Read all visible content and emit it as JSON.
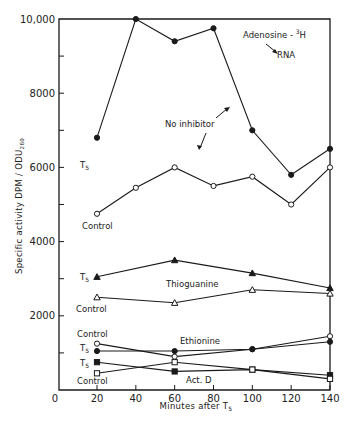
{
  "chart_data": {
    "type": "line",
    "xlabel": "Minutes after T5",
    "ylabel": "Specific activity DPM / ODU260",
    "xlim": [
      0,
      140
    ],
    "ylim": [
      0,
      10000
    ],
    "x_ticks": [
      0,
      20,
      40,
      60,
      80,
      100,
      120,
      140
    ],
    "y_ticks": [
      2000,
      4000,
      6000,
      8000,
      10000
    ],
    "y_tick_labels": [
      "2000",
      "4000",
      "6000",
      "8000",
      "10,000"
    ],
    "grid": false,
    "annotations": [
      "Adenosine - 3H",
      "RNA",
      "No inhibitor",
      "Thioguanine",
      "Ethionine",
      "Act. D"
    ],
    "series": [
      {
        "name": "No inhibitor T5",
        "group": "No inhibitor",
        "label": "T5",
        "marker": "filled-circle",
        "x": [
          20,
          40,
          60,
          80,
          100,
          120,
          140
        ],
        "values": [
          6800,
          10000,
          9400,
          9750,
          7000,
          5800,
          6500
        ]
      },
      {
        "name": "No inhibitor Control",
        "group": "No inhibitor",
        "label": "Control",
        "marker": "open-circle",
        "x": [
          20,
          40,
          60,
          80,
          100,
          120,
          140
        ],
        "values": [
          4750,
          5450,
          6000,
          5500,
          5750,
          5000,
          6000
        ]
      },
      {
        "name": "Thioguanine T5",
        "group": "Thioguanine",
        "label": "T5",
        "marker": "filled-triangle",
        "x": [
          20,
          60,
          100,
          140
        ],
        "values": [
          3050,
          3500,
          3150,
          2750
        ]
      },
      {
        "name": "Thioguanine Control",
        "group": "Thioguanine",
        "label": "Control",
        "marker": "open-triangle",
        "x": [
          20,
          60,
          100,
          140
        ],
        "values": [
          2500,
          2350,
          2700,
          2600
        ]
      },
      {
        "name": "Ethionine Control",
        "group": "Ethionine",
        "label": "Control",
        "marker": "open-circle",
        "x": [
          20,
          60,
          100,
          140
        ],
        "values": [
          1250,
          900,
          1100,
          1450
        ]
      },
      {
        "name": "Ethionine T5",
        "group": "Ethionine",
        "label": "T5",
        "marker": "filled-circle",
        "x": [
          20,
          60,
          100,
          140
        ],
        "values": [
          1050,
          1050,
          1100,
          1300
        ]
      },
      {
        "name": "Act. D T5",
        "group": "Act. D",
        "label": "T5",
        "marker": "filled-square",
        "x": [
          20,
          60,
          100,
          140
        ],
        "values": [
          750,
          500,
          550,
          400
        ]
      },
      {
        "name": "Act. D Control",
        "group": "Act. D",
        "label": "Control",
        "marker": "open-square",
        "x": [
          20,
          60,
          100,
          140
        ],
        "values": [
          450,
          750,
          550,
          300
        ]
      }
    ]
  },
  "labels": {
    "title_line1": "Adenosine - ",
    "title_sup": "3",
    "title_H": "H",
    "title_line2": "RNA",
    "no_inhibitor": "No inhibitor",
    "thioguanine": "Thioguanine",
    "ethionine": "Ethionine",
    "actd": "Act. D",
    "t5": "T",
    "t5_sub": "5",
    "control": "Control",
    "xlabel_main": "Minutes after T",
    "xlabel_sub": "5",
    "ylabel_main": "Specific activity DPM / ODU",
    "ylabel_sub": "260"
  },
  "colors": {
    "ink": "#1a1a1a",
    "background": "#ffffff"
  }
}
